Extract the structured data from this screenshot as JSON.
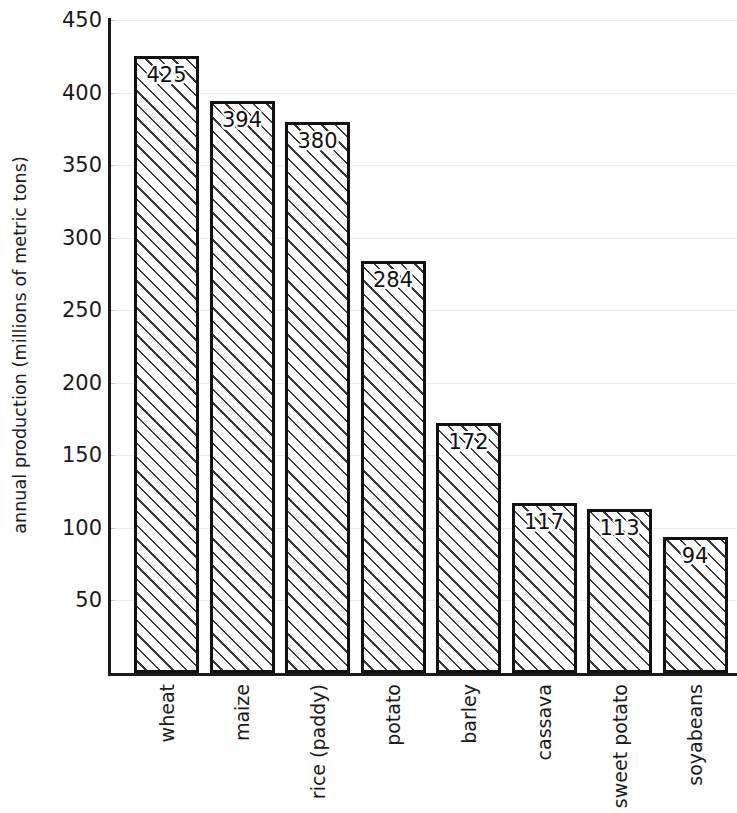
{
  "chart_data": {
    "type": "bar",
    "title": "",
    "subtitle": "",
    "xlabel": "",
    "ylabel": "annual production (millions of metric tons)",
    "categories": [
      "wheat",
      "maize",
      "rice (paddy)",
      "potato",
      "barley",
      "cassava",
      "sweet potato",
      "soyabeans"
    ],
    "values": [
      425,
      394,
      380,
      284,
      172,
      117,
      113,
      94
    ],
    "value_labels": [
      "425",
      "394",
      "380",
      "284",
      "172",
      "117",
      "113",
      "94"
    ],
    "ylim": [
      0,
      455
    ],
    "yticks": [
      450,
      400,
      350,
      300,
      250,
      200,
      150,
      100,
      50
    ],
    "ytick_labels": [
      "450",
      "400",
      "350",
      "300",
      "250",
      "200",
      "150",
      "100",
      "50"
    ],
    "grid": true,
    "grid_axis": "y",
    "legend": false,
    "legend_position": "none",
    "orientation": "vertical",
    "bar_fill": "hatched-diagonal",
    "bar_edge_color": "#111111",
    "bar_face_color": "#ffffff",
    "hatch_color": "#3b3b3b",
    "grid_color": "#ededed",
    "axis_color": "#1a1a1a",
    "text_color": "#1a1a1a",
    "background_color": "#ffffff",
    "value_label_position": "inside-top",
    "category_label_rotation": 90
  }
}
